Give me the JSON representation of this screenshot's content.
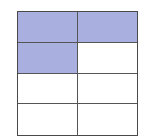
{
  "diagram": {
    "type": "fraction-grid",
    "rows": 4,
    "columns": 2,
    "shaded_color": "#a9b0e0",
    "line_color": "#4a4a4a",
    "cells": [
      {
        "row": 0,
        "col": 0,
        "shaded": true
      },
      {
        "row": 0,
        "col": 1,
        "shaded": true
      },
      {
        "row": 1,
        "col": 0,
        "shaded": true
      },
      {
        "row": 1,
        "col": 1,
        "shaded": false
      },
      {
        "row": 2,
        "col": 0,
        "shaded": false
      },
      {
        "row": 2,
        "col": 1,
        "shaded": false
      },
      {
        "row": 3,
        "col": 0,
        "shaded": false
      },
      {
        "row": 3,
        "col": 1,
        "shaded": false
      }
    ],
    "shaded_count": 3,
    "total_count": 8
  }
}
